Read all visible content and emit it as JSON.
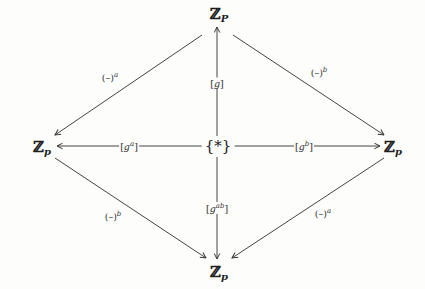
{
  "diagram": {
    "type": "commutative-diagram",
    "nodes": {
      "top": {
        "base": "Z",
        "subscript": "P"
      },
      "left": {
        "base": "Z",
        "subscript": "p"
      },
      "right": {
        "base": "Z",
        "subscript": "p"
      },
      "bottom": {
        "base": "Z",
        "subscript": "p"
      },
      "center": {
        "text": "{*}"
      }
    },
    "edges": {
      "center_to_top": {
        "bracket_open": "[",
        "var": "g",
        "sup": "",
        "bracket_close": "]"
      },
      "center_to_left": {
        "bracket_open": "[",
        "var": "g",
        "sup": "a",
        "bracket_close": "]"
      },
      "center_to_right": {
        "bracket_open": "[",
        "var": "g",
        "sup": "b",
        "bracket_close": "]"
      },
      "center_to_bottom": {
        "bracket_open": "[",
        "var": "g",
        "sup": "ab",
        "bracket_close": "]"
      },
      "top_to_left": {
        "base": "(–)",
        "sup": "a"
      },
      "top_to_right": {
        "base": "(–)",
        "sup": "b"
      },
      "left_to_bottom": {
        "base": "(–)",
        "sup": "b"
      },
      "right_to_bottom": {
        "base": "(–)",
        "sup": "a"
      }
    },
    "colors": {
      "ink": "#2a2a2a",
      "paper": "#fdfdfb"
    }
  }
}
